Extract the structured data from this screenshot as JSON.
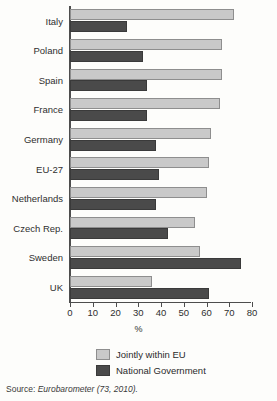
{
  "chart_data": {
    "type": "bar",
    "orientation": "horizontal",
    "title": "",
    "subtitle": "",
    "xlabel": "%",
    "ylabel": "",
    "xlim": [
      0,
      80
    ],
    "xticks": [
      0,
      10,
      20,
      30,
      40,
      50,
      60,
      70,
      80
    ],
    "xtick_labels": [
      "0",
      "10",
      "20",
      "30",
      "40",
      "50",
      "60",
      "70",
      "80"
    ],
    "grid": false,
    "legend_position": "bottom",
    "categories": [
      "Italy",
      "Poland",
      "Spain",
      "France",
      "Germany",
      "EU-27",
      "Netherlands",
      "Czech Rep.",
      "Sweden",
      "UK"
    ],
    "series": [
      {
        "name": "Jointly within EU",
        "color": "#c9c9c9",
        "values": [
          72,
          67,
          67,
          66,
          62,
          61,
          60,
          55,
          57,
          36
        ]
      },
      {
        "name": "National Government",
        "color": "#4a4a4a",
        "values": [
          25,
          32,
          34,
          34,
          38,
          39,
          38,
          43,
          75,
          61
        ]
      }
    ],
    "annotations": []
  },
  "source": {
    "label": "Source:",
    "text": "Eurobarometer (73, 2010)."
  },
  "colors": {
    "light_bar": "#c9c9c9",
    "light_bar_edge": "#8e8e8e",
    "dark_bar": "#4a4a4a",
    "dark_bar_edge": "#3a3a3a",
    "axis": "#4d4d4d",
    "background": "#fdfdfb",
    "text": "#2b2b2b"
  }
}
